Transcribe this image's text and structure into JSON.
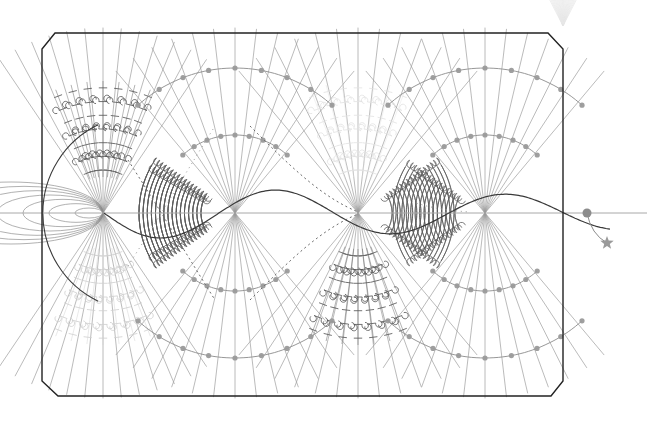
{
  "canvas": {
    "width": 647,
    "height": 422,
    "background": "#ffffff",
    "title": "Abstract Generative Field Diagram"
  },
  "palette": {
    "frame_stroke": "#222222",
    "node_gray": "#8c8c8c",
    "ray_gray": "#9a9a9a",
    "arc_dark": "#5a5a5a",
    "arc_mid": "#777777",
    "faint": "#d8d8d8",
    "very_faint": "#ececec",
    "dot_fill": "#9a9a9a",
    "star_fill": "#9a9a9a",
    "axis_gray": "#a8a8a8"
  },
  "frame": {
    "name": "chamfered-rectangle",
    "points": "55,33 548,33 563,49 563,381 551,396 58,396 42,381 42,49",
    "stroke_width": 1.4
  },
  "axis": {
    "y": 213,
    "x_start": 0,
    "x_end": 647,
    "stroke_width": 1
  },
  "nodes": [
    {
      "id": "n1",
      "x": 103,
      "y": 213,
      "r": 0,
      "label": "node-1"
    },
    {
      "id": "n2",
      "x": 235,
      "y": 213,
      "r": 0,
      "label": "node-2"
    },
    {
      "id": "n3",
      "x": 358,
      "y": 213,
      "r": 0,
      "label": "node-3"
    },
    {
      "id": "n4",
      "x": 485,
      "y": 213,
      "r": 0,
      "label": "node-4"
    },
    {
      "id": "n5",
      "x": 587,
      "y": 213,
      "r": 4.5,
      "label": "node-5-terminal"
    }
  ],
  "star_marker": {
    "x": 607,
    "y": 243,
    "size": 7,
    "label": "star-marker"
  },
  "star_link": {
    "from_x": 587,
    "from_y": 213,
    "to_x": 607,
    "to_y": 243
  },
  "ray_fans": [
    {
      "id": "f1",
      "cx": 103,
      "cy": 213,
      "count": 13,
      "spread_deg": 34,
      "len": 185,
      "dir": "up",
      "opacity": 0.85,
      "width": 0.8
    },
    {
      "id": "f2",
      "cx": 103,
      "cy": 213,
      "count": 13,
      "spread_deg": 34,
      "len": 185,
      "dir": "down",
      "opacity": 0.85,
      "width": 0.8
    },
    {
      "id": "f3",
      "cx": 235,
      "cy": 213,
      "count": 13,
      "spread_deg": 40,
      "len": 185,
      "dir": "up",
      "opacity": 0.85,
      "width": 0.8
    },
    {
      "id": "f4",
      "cx": 235,
      "cy": 213,
      "count": 13,
      "spread_deg": 40,
      "len": 185,
      "dir": "down",
      "opacity": 0.85,
      "width": 0.8
    },
    {
      "id": "f5",
      "cx": 358,
      "cy": 213,
      "count": 13,
      "spread_deg": 40,
      "len": 185,
      "dir": "up",
      "opacity": 0.85,
      "width": 0.8
    },
    {
      "id": "f6",
      "cx": 358,
      "cy": 213,
      "count": 13,
      "spread_deg": 40,
      "len": 185,
      "dir": "down",
      "opacity": 0.85,
      "width": 0.8
    },
    {
      "id": "f7",
      "cx": 485,
      "cy": 213,
      "count": 13,
      "spread_deg": 40,
      "len": 185,
      "dir": "up",
      "opacity": 0.85,
      "width": 0.8
    },
    {
      "id": "f8",
      "cx": 485,
      "cy": 213,
      "count": 13,
      "spread_deg": 40,
      "len": 185,
      "dir": "down",
      "opacity": 0.85,
      "width": 0.8
    }
  ],
  "dotted_arc_fans": [
    {
      "id": "d1",
      "cx": 235,
      "cy": 213,
      "dir": "up",
      "radii": [
        78,
        145
      ],
      "dots": 9,
      "spread_deg": 42
    },
    {
      "id": "d2",
      "cx": 235,
      "cy": 213,
      "dir": "down",
      "radii": [
        78,
        145
      ],
      "dots": 9,
      "spread_deg": 42
    },
    {
      "id": "d3",
      "cx": 485,
      "cy": 213,
      "dir": "up",
      "radii": [
        78,
        145
      ],
      "dots": 9,
      "spread_deg": 42
    },
    {
      "id": "d4",
      "cx": 485,
      "cy": 213,
      "dir": "down",
      "radii": [
        78,
        145
      ],
      "dots": 9,
      "spread_deg": 42
    }
  ],
  "arc_bands": [
    {
      "id": "a1",
      "cx": 235,
      "cy": 213,
      "facing": "left",
      "count": 16,
      "r_min": 34,
      "r_max": 96,
      "arc_from": 150,
      "arc_to": 215,
      "color": "#5a5a5a"
    },
    {
      "id": "a2",
      "cx": 235,
      "cy": 213,
      "facing": "left",
      "count": 16,
      "r_min": 34,
      "r_max": 96,
      "arc_from": 145,
      "arc_to": 210,
      "color": "#5a5a5a",
      "mirror": true
    },
    {
      "id": "a3",
      "cx": 358,
      "cy": 213,
      "facing": "right",
      "count": 16,
      "r_min": 34,
      "r_max": 96,
      "arc_from": 150,
      "arc_to": 215,
      "color": "#5a5a5a"
    },
    {
      "id": "a4",
      "cx": 485,
      "cy": 213,
      "facing": "left",
      "count": 15,
      "r_min": 30,
      "r_max": 92,
      "arc_from": 150,
      "arc_to": 215,
      "color": "#5a5a5a"
    }
  ],
  "barb_clusters": [
    {
      "id": "b1",
      "cx": 103,
      "cy": 213,
      "dir": "up",
      "color": "#5a5a5a",
      "opacity": 0.95,
      "lines": 7,
      "ticks": 7
    },
    {
      "id": "b2",
      "cx": 103,
      "cy": 213,
      "dir": "down",
      "color": "#cfcfcf",
      "opacity": 0.9,
      "lines": 7,
      "ticks": 7
    },
    {
      "id": "b3",
      "cx": 358,
      "cy": 213,
      "dir": "up",
      "color": "#e2e2e2",
      "opacity": 0.9,
      "lines": 7,
      "ticks": 7
    },
    {
      "id": "b4",
      "cx": 358,
      "cy": 213,
      "dir": "down",
      "color": "#5a5a5a",
      "opacity": 0.95,
      "lines": 7,
      "ticks": 7
    }
  ],
  "ellipse_cluster": {
    "cx": 103,
    "cy": 213,
    "count": 7,
    "rx_min": 14,
    "rx_max": 92,
    "ry_min": 5,
    "ry_max": 31,
    "color": "#8c8c8c",
    "left_edge_arc": {
      "cx": 103,
      "cy": 213,
      "r": 98
    }
  },
  "sine_wave": {
    "x_start": 104,
    "x_end": 610,
    "baseline": 213,
    "amplitude": 26,
    "cycles": 2.2,
    "color": "#3a3a3a",
    "width": 1.2
  },
  "dotted_curves": [
    {
      "id": "dc1",
      "color": "#6a6a6a",
      "dash": "2,3"
    },
    {
      "id": "dc2",
      "color": "#9a9a9a",
      "dash": "1,4"
    }
  ],
  "ghost_fan": {
    "x": 520,
    "y": 0,
    "width": 86,
    "height": 22,
    "color": "#e6e6e6",
    "label": "faint-top-right-artifact"
  },
  "legend_hidden": true
}
